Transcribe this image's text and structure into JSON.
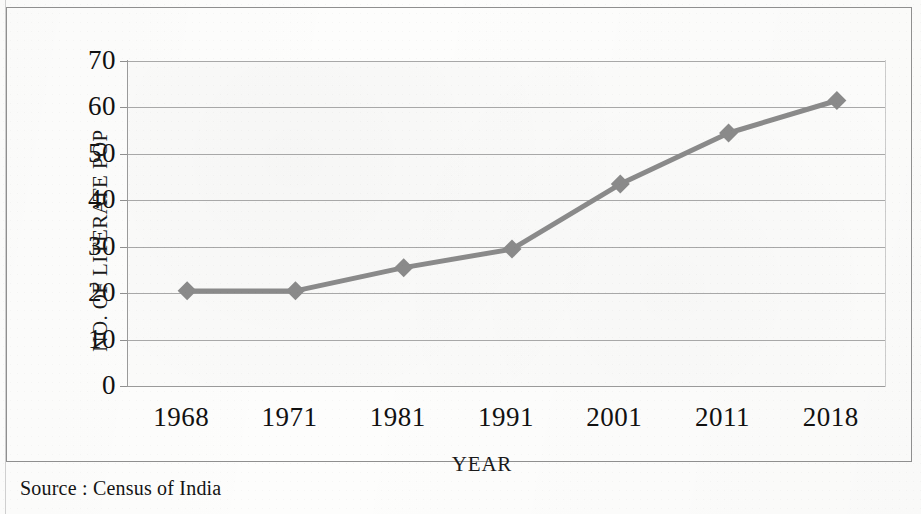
{
  "figure": {
    "source_note": "Source : Census of India"
  },
  "chart_data": {
    "type": "line",
    "title": "",
    "subtitle": "",
    "xlabel": "YEAR",
    "ylabel": "NO. OF LITERATE POP",
    "categories": [
      "1968",
      "1971",
      "1981",
      "1991",
      "2001",
      "2011",
      "2018"
    ],
    "values": [
      22,
      22,
      27,
      31,
      45,
      56,
      63
    ],
    "series": [
      {
        "name": "NO. OF LITERATE POP",
        "values": [
          22,
          22,
          27,
          31,
          45,
          56,
          63
        ],
        "color": "#8a8a8a",
        "marker": "diamond"
      }
    ],
    "ylim": [
      0,
      70
    ],
    "yticks": [
      0,
      10,
      20,
      30,
      40,
      50,
      60,
      70
    ],
    "ytick_labels": [
      "0",
      "10",
      "20",
      "30",
      "40",
      "50",
      "60",
      "70"
    ],
    "grid": true,
    "grid_axis": "y",
    "legend": false,
    "legend_position": "none",
    "annotations": [
      "Source : Census of India"
    ],
    "colors": {
      "line": "#8a8a8a",
      "marker": "#8a8a8a",
      "gridline": "#a8a8a8",
      "axis": "#9a9a9a",
      "plot_background": "#fbfbfa",
      "text": "#111111",
      "frame": "#8f8f8f"
    }
  }
}
